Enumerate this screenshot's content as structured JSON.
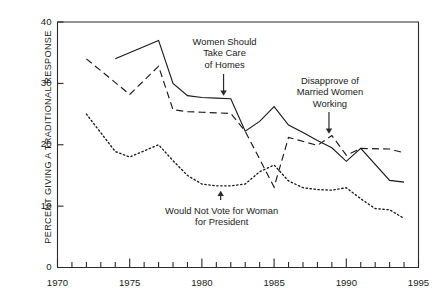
{
  "chart_data": {
    "type": "line",
    "title": "",
    "xlabel": "",
    "ylabel": "PERCENT GIVING A TRADITIONAL RESPONSE",
    "xlim": [
      1970,
      1995
    ],
    "ylim": [
      0,
      40
    ],
    "grid": false,
    "legend_position": "inline-annotations",
    "x_ticks_major": [
      1970,
      1975,
      1980,
      1985,
      1990,
      1995
    ],
    "x_tick_labels": [
      "1970",
      "1975",
      "1980",
      "1985",
      "1990",
      "1995"
    ],
    "x_ticks_minor_step": 1,
    "y_ticks": [
      0,
      10,
      20,
      30,
      40
    ],
    "y_tick_labels": [
      "0",
      "10",
      "20",
      "30",
      "40"
    ],
    "series": [
      {
        "name": "Women Should Take Care of Homes",
        "style": "solid",
        "color": "#1a1a1a",
        "x": [
          1974,
          1977,
          1978,
          1979,
          1980,
          1981,
          1982,
          1983,
          1984,
          1985,
          1986,
          1987,
          1988,
          1989,
          1990,
          1991,
          1993,
          1994
        ],
        "values": [
          34.0,
          37.0,
          30.0,
          28.0,
          27.7,
          27.6,
          27.5,
          22.2,
          23.8,
          26.2,
          23.2,
          22.0,
          20.7,
          19.5,
          17.3,
          19.4,
          14.2,
          13.9
        ]
      },
      {
        "name": "Disapprove of Married Women Working",
        "style": "dashed",
        "color": "#1a1a1a",
        "x": [
          1972,
          1975,
          1977,
          1978,
          1979,
          1980,
          1981,
          1982,
          1983,
          1985,
          1986,
          1988,
          1989,
          1990,
          1991,
          1993,
          1994
        ],
        "values": [
          34.0,
          28.2,
          32.8,
          25.7,
          25.4,
          25.3,
          25.2,
          25.1,
          22.2,
          13.1,
          21.2,
          19.9,
          21.5,
          18.3,
          19.4,
          19.3,
          18.7
        ]
      },
      {
        "name": "Would Not Vote for Woman for President",
        "style": "dotted",
        "color": "#1a1a1a",
        "x": [
          1972,
          1974,
          1975,
          1977,
          1978,
          1979,
          1980,
          1981,
          1982,
          1983,
          1984,
          1985,
          1986,
          1987,
          1988,
          1989,
          1990,
          1991,
          1992,
          1993,
          1994
        ],
        "values": [
          25.0,
          18.9,
          18.0,
          20.0,
          17.4,
          15.0,
          13.6,
          13.3,
          13.3,
          13.6,
          15.6,
          16.7,
          14.1,
          13.0,
          12.7,
          12.6,
          13.0,
          11.2,
          9.6,
          9.4,
          8.0
        ]
      }
    ],
    "annotations": [
      {
        "id": "annot-homes",
        "lines": [
          "Women Should",
          "Take Care",
          "of Homes"
        ],
        "target_x": 1981.5,
        "target_y": 28.0,
        "arrow_direction": "down"
      },
      {
        "id": "annot-married",
        "lines": [
          "Disapprove of",
          "Married Women",
          "Working"
        ],
        "target_x": 1988.8,
        "target_y": 21.8,
        "arrow_direction": "down"
      },
      {
        "id": "annot-president",
        "lines": [
          "Would Not Vote for Woman",
          "for President"
        ],
        "target_x": 1981.3,
        "target_y": 12.5,
        "arrow_direction": "up"
      }
    ]
  }
}
